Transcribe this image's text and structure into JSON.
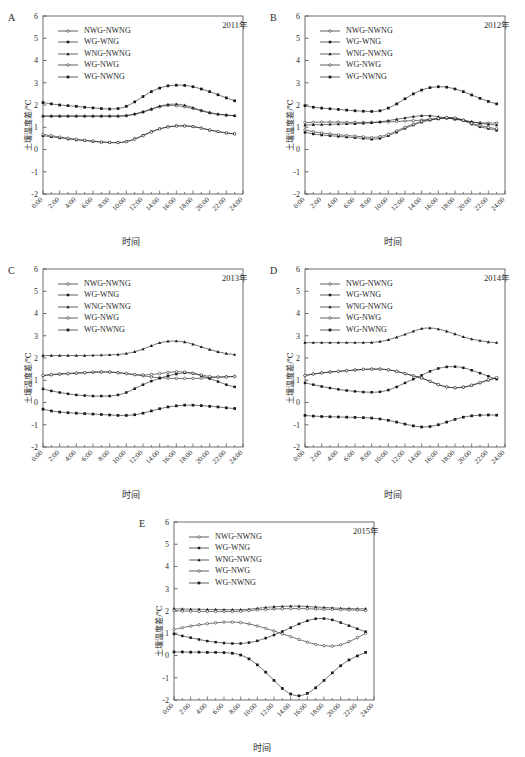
{
  "figure": {
    "axis": {
      "xlabel": "时间",
      "ylabel": "土壤温度差/℃",
      "xticks": [
        "0:00",
        "2:00",
        "4:00",
        "6:00",
        "8:00",
        "10:00",
        "12:00",
        "14:00",
        "16:00",
        "18:00",
        "20:00",
        "22:00",
        "24:00"
      ],
      "yticks": [
        "-2",
        "-1",
        "0",
        "1",
        "2",
        "3",
        "4",
        "5",
        "6"
      ],
      "ylim": [
        -2,
        6
      ],
      "xlim": [
        0,
        24
      ]
    },
    "series_names": [
      "NWG-NWNG",
      "WG-WNG",
      "WNG-NWNG",
      "WG-NWG",
      "WG-NWNG"
    ],
    "colors": {
      "line": "#1a1a1a",
      "axis": "#4a4a4a",
      "background": "#ffffff"
    }
  },
  "panels": [
    {
      "letter": "A",
      "year": "2011年"
    },
    {
      "letter": "B",
      "year": "2012年"
    },
    {
      "letter": "C",
      "year": "2013年"
    },
    {
      "letter": "D",
      "year": "2014年"
    },
    {
      "letter": "E",
      "year": "2015年"
    }
  ],
  "chart_data": [
    {
      "type": "line",
      "panel": "A",
      "title": "2011年",
      "xlabel": "时间",
      "ylabel": "土壤温度差/℃",
      "ylim": [
        -2,
        6
      ],
      "grid": false,
      "legend": "upper-left",
      "x": [
        "0:00",
        "1:00",
        "2:00",
        "3:00",
        "4:00",
        "5:00",
        "6:00",
        "7:00",
        "8:00",
        "9:00",
        "10:00",
        "11:00",
        "12:00",
        "13:00",
        "14:00",
        "15:00",
        "16:00",
        "17:00",
        "18:00",
        "19:00",
        "20:00",
        "21:00",
        "22:00",
        "23:00"
      ],
      "series": [
        {
          "name": "NWG-NWNG",
          "values": [
            1.5,
            1.5,
            1.5,
            1.5,
            1.5,
            1.5,
            1.5,
            1.5,
            1.5,
            1.5,
            1.52,
            1.58,
            1.68,
            1.8,
            1.92,
            1.98,
            1.97,
            1.92,
            1.84,
            1.74,
            1.64,
            1.58,
            1.54,
            1.52
          ]
        },
        {
          "name": "WG-WNG",
          "values": [
            0.62,
            0.57,
            0.52,
            0.47,
            0.43,
            0.4,
            0.36,
            0.33,
            0.31,
            0.31,
            0.36,
            0.48,
            0.64,
            0.8,
            0.93,
            1.02,
            1.06,
            1.06,
            1.03,
            0.96,
            0.87,
            0.8,
            0.74,
            0.7
          ]
        },
        {
          "name": "WNG-NWNG",
          "values": [
            1.5,
            1.5,
            1.5,
            1.5,
            1.5,
            1.5,
            1.5,
            1.5,
            1.5,
            1.5,
            1.53,
            1.6,
            1.7,
            1.82,
            1.95,
            2.02,
            2.04,
            1.99,
            1.88,
            1.76,
            1.66,
            1.59,
            1.55,
            1.52
          ]
        },
        {
          "name": "WG-NWG",
          "values": [
            0.68,
            0.62,
            0.56,
            0.51,
            0.46,
            0.42,
            0.38,
            0.34,
            0.32,
            0.31,
            0.35,
            0.46,
            0.62,
            0.78,
            0.92,
            1.01,
            1.05,
            1.06,
            1.03,
            0.96,
            0.88,
            0.81,
            0.75,
            0.7
          ]
        },
        {
          "name": "WG-NWNG",
          "values": [
            2.11,
            2.05,
            2.0,
            1.97,
            1.94,
            1.9,
            1.87,
            1.84,
            1.82,
            1.84,
            1.94,
            2.14,
            2.38,
            2.6,
            2.76,
            2.86,
            2.89,
            2.88,
            2.82,
            2.72,
            2.6,
            2.46,
            2.32,
            2.19
          ]
        }
      ]
    },
    {
      "type": "line",
      "panel": "B",
      "title": "2012年",
      "xlabel": "时间",
      "ylabel": "土壤温度差/℃",
      "ylim": [
        -2,
        6
      ],
      "grid": false,
      "legend": "upper-left",
      "x": [
        "0:00",
        "1:00",
        "2:00",
        "3:00",
        "4:00",
        "5:00",
        "6:00",
        "7:00",
        "8:00",
        "9:00",
        "10:00",
        "11:00",
        "12:00",
        "13:00",
        "14:00",
        "15:00",
        "16:00",
        "17:00",
        "18:00",
        "19:00",
        "20:00",
        "21:00",
        "22:00",
        "23:00"
      ],
      "series": [
        {
          "name": "NWG-NWNG",
          "values": [
            1.21,
            1.22,
            1.23,
            1.23,
            1.23,
            1.22,
            1.22,
            1.22,
            1.22,
            1.23,
            1.24,
            1.26,
            1.28,
            1.3,
            1.32,
            1.35,
            1.38,
            1.4,
            1.38,
            1.32,
            1.24,
            1.2,
            1.19,
            1.19
          ]
        },
        {
          "name": "WG-WNG",
          "values": [
            0.77,
            0.7,
            0.65,
            0.62,
            0.59,
            0.56,
            0.53,
            0.5,
            0.46,
            0.5,
            0.62,
            0.78,
            0.95,
            1.1,
            1.23,
            1.32,
            1.38,
            1.42,
            1.4,
            1.3,
            1.14,
            1.02,
            0.94,
            0.86
          ]
        },
        {
          "name": "WNG-NWNG",
          "values": [
            1.1,
            1.11,
            1.12,
            1.13,
            1.14,
            1.15,
            1.16,
            1.18,
            1.2,
            1.24,
            1.3,
            1.36,
            1.42,
            1.48,
            1.52,
            1.52,
            1.47,
            1.42,
            1.36,
            1.3,
            1.24,
            1.18,
            1.13,
            1.1
          ]
        },
        {
          "name": "WG-NWG",
          "values": [
            0.88,
            0.8,
            0.74,
            0.7,
            0.66,
            0.63,
            0.6,
            0.57,
            0.54,
            0.58,
            0.68,
            0.84,
            1.0,
            1.14,
            1.27,
            1.36,
            1.4,
            1.44,
            1.42,
            1.32,
            1.18,
            1.08,
            1.0,
            0.93
          ]
        },
        {
          "name": "WG-NWNG",
          "values": [
            1.97,
            1.9,
            1.86,
            1.83,
            1.8,
            1.77,
            1.74,
            1.72,
            1.71,
            1.74,
            1.86,
            2.05,
            2.28,
            2.5,
            2.67,
            2.78,
            2.82,
            2.8,
            2.72,
            2.6,
            2.45,
            2.3,
            2.16,
            2.05
          ]
        }
      ]
    },
    {
      "type": "line",
      "panel": "C",
      "title": "2013年",
      "xlabel": "时间",
      "ylabel": "土壤温度差/℃",
      "ylim": [
        -2,
        6
      ],
      "grid": false,
      "legend": "upper-left",
      "x": [
        "0:00",
        "1:00",
        "2:00",
        "3:00",
        "4:00",
        "5:00",
        "6:00",
        "7:00",
        "8:00",
        "9:00",
        "10:00",
        "11:00",
        "12:00",
        "13:00",
        "14:00",
        "15:00",
        "16:00",
        "17:00",
        "18:00",
        "19:00",
        "20:00",
        "21:00",
        "22:00",
        "23:00"
      ],
      "series": [
        {
          "name": "NWG-NWNG",
          "values": [
            1.2,
            1.24,
            1.27,
            1.29,
            1.31,
            1.33,
            1.35,
            1.37,
            1.37,
            1.34,
            1.3,
            1.25,
            1.2,
            1.15,
            1.11,
            1.09,
            1.08,
            1.08,
            1.08,
            1.09,
            1.11,
            1.14,
            1.16,
            1.17
          ]
        },
        {
          "name": "WG-WNG",
          "values": [
            0.61,
            0.52,
            0.45,
            0.39,
            0.34,
            0.31,
            0.29,
            0.29,
            0.29,
            0.34,
            0.45,
            0.62,
            0.8,
            0.96,
            1.09,
            1.2,
            1.28,
            1.33,
            1.3,
            1.2,
            1.08,
            0.94,
            0.8,
            0.7
          ]
        },
        {
          "name": "WNG-NWNG",
          "values": [
            2.11,
            2.11,
            2.11,
            2.11,
            2.11,
            2.11,
            2.12,
            2.13,
            2.14,
            2.16,
            2.2,
            2.28,
            2.4,
            2.55,
            2.68,
            2.75,
            2.76,
            2.72,
            2.62,
            2.5,
            2.38,
            2.28,
            2.2,
            2.15
          ]
        },
        {
          "name": "WG-NWG",
          "values": [
            1.22,
            1.26,
            1.29,
            1.31,
            1.33,
            1.35,
            1.37,
            1.38,
            1.37,
            1.34,
            1.3,
            1.26,
            1.24,
            1.26,
            1.3,
            1.35,
            1.38,
            1.37,
            1.32,
            1.24,
            1.17,
            1.14,
            1.15,
            1.17
          ]
        },
        {
          "name": "WG-NWNG",
          "values": [
            -0.3,
            -0.38,
            -0.43,
            -0.46,
            -0.48,
            -0.5,
            -0.52,
            -0.54,
            -0.56,
            -0.58,
            -0.58,
            -0.55,
            -0.48,
            -0.38,
            -0.28,
            -0.2,
            -0.15,
            -0.12,
            -0.12,
            -0.14,
            -0.17,
            -0.2,
            -0.24,
            -0.27
          ]
        }
      ]
    },
    {
      "type": "line",
      "panel": "D",
      "title": "2014年",
      "xlabel": "时间",
      "ylabel": "土壤温度差/℃",
      "ylim": [
        -2,
        6
      ],
      "grid": false,
      "legend": "upper-left",
      "x": [
        "0:00",
        "1:00",
        "2:00",
        "3:00",
        "4:00",
        "5:00",
        "6:00",
        "7:00",
        "8:00",
        "9:00",
        "10:00",
        "11:00",
        "12:00",
        "13:00",
        "14:00",
        "15:00",
        "16:00",
        "17:00",
        "18:00",
        "19:00",
        "20:00",
        "21:00",
        "22:00",
        "23:00"
      ],
      "series": [
        {
          "name": "NWG-NWNG",
          "values": [
            1.21,
            1.28,
            1.33,
            1.37,
            1.4,
            1.43,
            1.46,
            1.49,
            1.5,
            1.5,
            1.47,
            1.4,
            1.3,
            1.2,
            1.1,
            0.95,
            0.8,
            0.7,
            0.66,
            0.68,
            0.76,
            0.88,
            1.0,
            1.1
          ]
        },
        {
          "name": "WG-WNG",
          "values": [
            0.88,
            0.8,
            0.72,
            0.65,
            0.59,
            0.54,
            0.5,
            0.47,
            0.46,
            0.48,
            0.56,
            0.7,
            0.88,
            1.05,
            1.22,
            1.4,
            1.53,
            1.6,
            1.61,
            1.56,
            1.45,
            1.32,
            1.18,
            1.05
          ]
        },
        {
          "name": "WNG-NWNG",
          "values": [
            2.69,
            2.69,
            2.69,
            2.69,
            2.69,
            2.69,
            2.69,
            2.69,
            2.7,
            2.74,
            2.82,
            2.93,
            3.06,
            3.2,
            3.32,
            3.35,
            3.3,
            3.2,
            3.08,
            2.95,
            2.85,
            2.78,
            2.72,
            2.69
          ]
        },
        {
          "name": "WG-NWG",
          "values": [
            1.21,
            1.28,
            1.33,
            1.37,
            1.4,
            1.43,
            1.46,
            1.49,
            1.5,
            1.5,
            1.47,
            1.4,
            1.3,
            1.2,
            1.1,
            0.95,
            0.81,
            0.7,
            0.67,
            0.7,
            0.78,
            0.9,
            1.02,
            1.12
          ]
        },
        {
          "name": "WG-NWNG",
          "values": [
            -0.58,
            -0.61,
            -0.63,
            -0.64,
            -0.65,
            -0.66,
            -0.67,
            -0.68,
            -0.7,
            -0.74,
            -0.8,
            -0.88,
            -0.97,
            -1.05,
            -1.1,
            -1.08,
            -1.0,
            -0.88,
            -0.76,
            -0.66,
            -0.6,
            -0.57,
            -0.56,
            -0.57
          ]
        }
      ]
    },
    {
      "type": "line",
      "panel": "E",
      "title": "2015年",
      "xlabel": "时间",
      "ylabel": "土壤温度差/℃",
      "ylim": [
        -2,
        6
      ],
      "grid": false,
      "legend": "upper-left",
      "x": [
        "0:00",
        "1:00",
        "2:00",
        "3:00",
        "4:00",
        "5:00",
        "6:00",
        "7:00",
        "8:00",
        "9:00",
        "10:00",
        "11:00",
        "12:00",
        "13:00",
        "14:00",
        "15:00",
        "16:00",
        "17:00",
        "18:00",
        "19:00",
        "20:00",
        "21:00",
        "22:00",
        "23:00"
      ],
      "series": [
        {
          "name": "NWG-NWNG",
          "values": [
            1.17,
            1.25,
            1.32,
            1.38,
            1.43,
            1.47,
            1.5,
            1.5,
            1.48,
            1.42,
            1.33,
            1.22,
            1.1,
            0.97,
            0.85,
            0.72,
            0.6,
            0.5,
            0.44,
            0.42,
            0.48,
            0.62,
            0.8,
            1.0
          ]
        },
        {
          "name": "WG-WNG",
          "values": [
            0.97,
            0.88,
            0.8,
            0.72,
            0.65,
            0.6,
            0.56,
            0.54,
            0.54,
            0.58,
            0.66,
            0.78,
            0.92,
            1.08,
            1.25,
            1.42,
            1.56,
            1.65,
            1.66,
            1.6,
            1.48,
            1.34,
            1.2,
            1.07
          ]
        },
        {
          "name": "WNG-NWNG",
          "values": [
            2.1,
            2.09,
            2.08,
            2.08,
            2.07,
            2.07,
            2.06,
            2.06,
            2.06,
            2.08,
            2.12,
            2.16,
            2.19,
            2.21,
            2.22,
            2.22,
            2.2,
            2.18,
            2.16,
            2.14,
            2.12,
            2.11,
            2.1,
            2.1
          ]
        },
        {
          "name": "WG-NWG",
          "values": [
            2.02,
            2.0,
            1.99,
            1.98,
            1.98,
            1.98,
            1.98,
            1.98,
            1.99,
            2.02,
            2.05,
            2.07,
            2.09,
            2.1,
            2.11,
            2.11,
            2.1,
            2.09,
            2.08,
            2.07,
            2.06,
            2.05,
            2.04,
            2.02
          ]
        },
        {
          "name": "WG-NWNG",
          "values": [
            0.16,
            0.16,
            0.15,
            0.15,
            0.14,
            0.14,
            0.13,
            0.1,
            0.02,
            -0.15,
            -0.42,
            -0.75,
            -1.12,
            -1.48,
            -1.73,
            -1.81,
            -1.7,
            -1.45,
            -1.12,
            -0.78,
            -0.46,
            -0.2,
            -0.02,
            0.14
          ]
        }
      ]
    }
  ]
}
